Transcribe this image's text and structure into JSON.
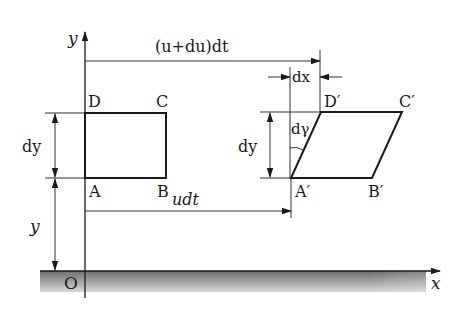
{
  "diagram": {
    "axes": {
      "x_label": "x",
      "y_label": "y",
      "origin_label": "O"
    },
    "original_element": {
      "vertices": [
        "A",
        "B",
        "C",
        "D"
      ]
    },
    "deformed_element": {
      "vertices": [
        "A′",
        "B′",
        "C′",
        "D′"
      ]
    },
    "dimensions": {
      "top_displacement": "(u+du)dt",
      "bottom_displacement": "udt",
      "shift": "dx",
      "height_left": "dy",
      "height_right": "dy",
      "elevation": "y",
      "shear_angle": "dγ"
    },
    "colors": {
      "line": "#1a1a1a",
      "ground_dark": "#6e6e6e",
      "ground_light": "#d4d4d4"
    }
  }
}
